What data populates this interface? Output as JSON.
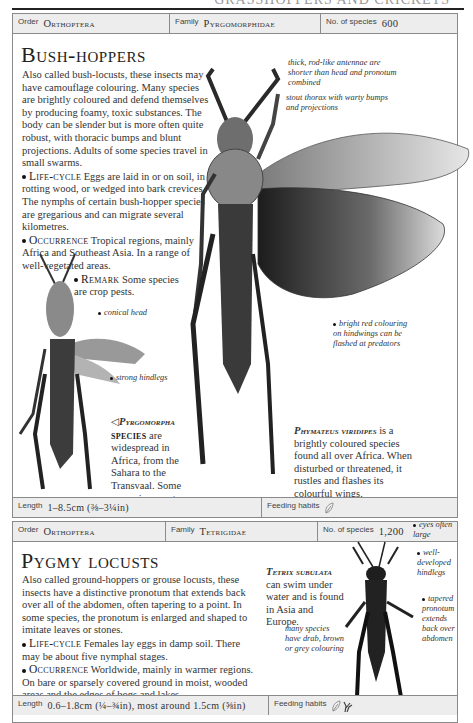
{
  "page": {
    "running_head": "GRASSHOPPERS AND CRICKETS"
  },
  "bush_hoppers": {
    "header": {
      "order_label": "Order",
      "order_value": "Orthoptera",
      "family_label": "Family",
      "family_value": "Pyrgomorphidae",
      "species_label": "No. of species",
      "species_value": "600"
    },
    "title": "Bush-hoppers",
    "intro": "Also called bush-locusts, these insects may have camouflage colouring. Many species are brightly coloured and defend themselves by producing foamy, toxic substances. The body can be slender but is more often quite robust, with thoracic bumps and blunt projections. Adults of some species travel in small swarms.",
    "life_cycle_label": "Life-cycle",
    "life_cycle_text": "Eggs are laid in or on soil, in rotting wood, or wedged into bark crevices. The nymphs of certain bush-hopper species are gregarious and can migrate several kilometres.",
    "occurrence_label": "Occurrence",
    "occurrence_text": "Tropical regions, mainly Africa and Southeast Asia. In a range of well-vegetated areas.",
    "remark_label": "Remark",
    "remark_text": "Some species are crop pests.",
    "annotations": {
      "antennae": "thick, rod-like antennae are shorter than head and pronotum combined",
      "thorax": "stout thorax with warty bumps and projections",
      "hindwings": "bright red colouring on hindwings can be flashed at predators",
      "conical_head": "conical head",
      "hindlegs": "strong hindlegs"
    },
    "pyrgomorpha_caption": {
      "arrow": "◁",
      "name": "Pyrgomorpha",
      "name2": "species",
      "text": "are widespread in Africa, from the Sahara to the Transvaal. Some are serious pests of crops."
    },
    "phymateus_caption": {
      "name": "Phymateus viridipes",
      "text": "is a brightly coloured species found all over Africa. When disturbed or threatened, it rustles and flashes its colourful wings."
    },
    "footer": {
      "length_label": "Length",
      "length_value": "1–8.5cm (⅜–3¼in)",
      "feeding_label": "Feeding habits",
      "feeding_icons": [
        "leaf-icon"
      ]
    }
  },
  "pygmy_locusts": {
    "header": {
      "order_label": "Order",
      "order_value": "Orthoptera",
      "family_label": "Family",
      "family_value": "Tetrigidae",
      "species_label": "No. of species",
      "species_value": "1,200"
    },
    "title": "Pygmy locusts",
    "intro": "Also called ground-hoppers or grouse locusts, these insects have a distinctive pronotum that extends back over all of the abdomen, often tapering to a point. In some species, the pronotum is enlarged and shaped to imitate leaves or stones.",
    "life_cycle_label": "Life-cycle",
    "life_cycle_text": "Females lay eggs in damp soil. There may be about five nymphal stages.",
    "occurrence_label": "Occurrence",
    "occurrence_text": "Worldwide, mainly in warmer regions. On bare or sparsely covered ground in moist, wooded areas and the edges of bogs and lakes.",
    "tetrix_caption": {
      "name": "Tetrix subulata",
      "text": "can swim under water and is found in Asia and Europe."
    },
    "annotations": {
      "eyes": "eyes often large",
      "hindlegs": "well-developed hindlegs",
      "pronotum": "tapered pronotum extends back over abdomen",
      "colouring": "many species have drab, brown or grey colouring"
    },
    "footer": {
      "length_label": "Length",
      "length_value": "0.6–1.8cm (¼–¾in), most around 1.5cm (⅝in)",
      "feeding_label": "Feeding habits",
      "feeding_icons": [
        "leaf-icon",
        "grass-icon"
      ]
    }
  }
}
